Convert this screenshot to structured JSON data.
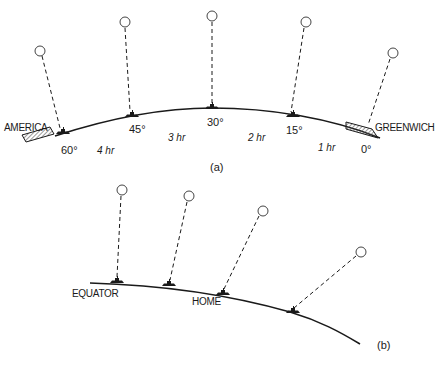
{
  "figure_a": {
    "caption": "(a)",
    "left_label": "AMERICA",
    "right_label": "GREENWICH",
    "degree_labels": [
      "60°",
      "45°",
      "30°",
      "15°",
      "0°"
    ],
    "hour_labels": [
      "4 hr",
      "3 hr",
      "2 hr",
      "1 hr"
    ],
    "stations": [
      {
        "name": "station-60",
        "balloon": [
          40,
          51
        ],
        "ship": [
          62,
          132
        ]
      },
      {
        "name": "station-45",
        "balloon": [
          125,
          22
        ],
        "ship": [
          130,
          115
        ]
      },
      {
        "name": "station-30",
        "balloon": [
          212,
          16
        ],
        "ship": [
          212,
          108
        ]
      },
      {
        "name": "station-15",
        "balloon": [
          305,
          22
        ],
        "ship": [
          292,
          117
        ]
      },
      {
        "name": "station-0",
        "balloon": [
          392,
          53
        ],
        "ship": [
          368,
          127
        ]
      }
    ]
  },
  "figure_b": {
    "caption": "(b)",
    "equator_label": "EQUATOR",
    "home_label": "HOME",
    "stations": [
      {
        "name": "station-1",
        "balloon": [
          122,
          190
        ],
        "ship": [
          117,
          281
        ]
      },
      {
        "name": "station-2",
        "balloon": [
          188,
          196
        ],
        "ship": [
          168,
          284
        ]
      },
      {
        "name": "station-3",
        "balloon": [
          262,
          211
        ],
        "ship": [
          222,
          293
        ]
      },
      {
        "name": "station-4",
        "balloon": [
          360,
          252
        ],
        "ship": [
          292,
          312
        ]
      }
    ]
  },
  "colors": {
    "ink": "#1a1a1a",
    "hatch": "#555555",
    "background": "#ffffff"
  }
}
